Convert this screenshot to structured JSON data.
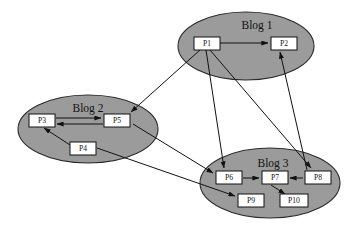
{
  "canvas": {
    "width": 358,
    "height": 228,
    "background": "#ffffff"
  },
  "palette": {
    "cluster_fill": "#9b9b9b",
    "cluster_stroke": "#2b2b2b",
    "node_fill": "#ffffff",
    "node_stroke": "#111111",
    "edge_stroke": "#111111"
  },
  "diagram": {
    "type": "directed-graph",
    "clusters": [
      {
        "id": "blog1",
        "label": "Blog 1",
        "cx": 246,
        "cy": 46,
        "rx": 68,
        "ry": 34,
        "label_x": 257,
        "label_y": 26
      },
      {
        "id": "blog2",
        "label": "Blog 2",
        "cx": 88,
        "cy": 129,
        "rx": 70,
        "ry": 34,
        "label_x": 88,
        "label_y": 109
      },
      {
        "id": "blog3",
        "label": "Blog 3",
        "cx": 270,
        "cy": 183,
        "rx": 70,
        "ry": 35,
        "label_x": 273,
        "label_y": 164
      }
    ],
    "nodes": [
      {
        "id": "P1",
        "label": "P1",
        "cluster": "blog1",
        "x": 194,
        "y": 37,
        "w": 26,
        "h": 13
      },
      {
        "id": "P2",
        "label": "P2",
        "cluster": "blog1",
        "x": 271,
        "y": 37,
        "w": 26,
        "h": 13
      },
      {
        "id": "P3",
        "label": "P3",
        "cluster": "blog2",
        "x": 29,
        "y": 114,
        "w": 26,
        "h": 13
      },
      {
        "id": "P5",
        "label": "P5",
        "cluster": "blog2",
        "x": 104,
        "y": 114,
        "w": 26,
        "h": 13
      },
      {
        "id": "P4",
        "label": "P4",
        "cluster": "blog2",
        "x": 70,
        "y": 142,
        "w": 26,
        "h": 13
      },
      {
        "id": "P6",
        "label": "P6",
        "cluster": "blog3",
        "x": 216,
        "y": 171,
        "w": 26,
        "h": 13
      },
      {
        "id": "P7",
        "label": "P7",
        "cluster": "blog3",
        "x": 262,
        "y": 171,
        "w": 26,
        "h": 13
      },
      {
        "id": "P8",
        "label": "P8",
        "cluster": "blog3",
        "x": 305,
        "y": 171,
        "w": 26,
        "h": 13
      },
      {
        "id": "P9",
        "label": "P9",
        "cluster": "blog3",
        "x": 238,
        "y": 194,
        "w": 26,
        "h": 13
      },
      {
        "id": "P10",
        "label": "P10",
        "cluster": "blog3",
        "x": 280,
        "y": 194,
        "w": 28,
        "h": 13
      }
    ],
    "edges": [
      {
        "from": "P1",
        "to": "P2",
        "x1": 220,
        "y1": 43,
        "x2": 268,
        "y2": 43
      },
      {
        "from": "P3",
        "to": "P5",
        "x1": 56,
        "y1": 118,
        "x2": 101,
        "y2": 118
      },
      {
        "from": "P5",
        "to": "P3",
        "x1": 103,
        "y1": 124,
        "x2": 57,
        "y2": 124
      },
      {
        "from": "P4",
        "to": "P3",
        "x1": 70,
        "y1": 145,
        "x2": 44,
        "y2": 128
      },
      {
        "from": "P6",
        "to": "P7",
        "x1": 243,
        "y1": 178,
        "x2": 259,
        "y2": 178
      },
      {
        "from": "P8",
        "to": "P7",
        "x1": 303,
        "y1": 178,
        "x2": 290,
        "y2": 178
      },
      {
        "from": "P7",
        "to": "P10",
        "x1": 271,
        "y1": 185,
        "x2": 285,
        "y2": 194
      },
      {
        "from": "P1",
        "to": "P5",
        "x1": 200,
        "y1": 50,
        "x2": 131,
        "y2": 112
      },
      {
        "from": "P1",
        "to": "P6",
        "x1": 206,
        "y1": 50,
        "x2": 224,
        "y2": 168
      },
      {
        "from": "P1",
        "to": "P8",
        "x1": 210,
        "y1": 50,
        "x2": 311,
        "y2": 168
      },
      {
        "from": "P8",
        "to": "P2",
        "x1": 307,
        "y1": 170,
        "x2": 280,
        "y2": 52
      },
      {
        "from": "P5",
        "to": "P6",
        "x1": 133,
        "y1": 124,
        "x2": 213,
        "y2": 173
      },
      {
        "from": "P4",
        "to": "P9",
        "x1": 97,
        "y1": 148,
        "x2": 235,
        "y2": 196
      }
    ]
  }
}
